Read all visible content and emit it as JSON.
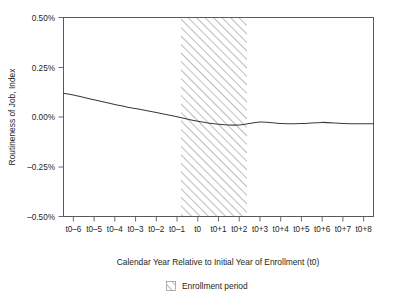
{
  "chart_data": {
    "type": "line",
    "title": "",
    "xlabel": "Calendar Year Relative to Initial Year of Enrollment (t0)",
    "ylabel": "Routineness of Job, Index",
    "x": [
      "t0–6",
      "t0–5",
      "t0–4",
      "t0–3",
      "t0–2",
      "t0–1",
      "t0",
      "t0+1",
      "t0+2",
      "t0+3",
      "t0+4",
      "t0+5",
      "t0+6",
      "t0+7",
      "t0+8"
    ],
    "xtick_labels": [
      "t0–6",
      "t0–5",
      "t0–4",
      "t0–3",
      "t0–2",
      "t0–1",
      "t0",
      "t0+1",
      "t0+2",
      "t0+3",
      "t0+4",
      "t0+5",
      "t0+6",
      "t0+7",
      "t0+8"
    ],
    "ytick_labels": [
      "0.50%",
      "0.25%",
      "0.00%",
      "–0.25%",
      "–0.50%"
    ],
    "ytick_values": [
      0.5,
      0.25,
      0.0,
      -0.25,
      -0.5
    ],
    "ylim": [
      -0.5,
      0.5
    ],
    "grid": false,
    "legend_position": "below-axis-center",
    "series": [
      {
        "name": "Routineness of Job, Index",
        "values": [
          0.11,
          0.086,
          0.063,
          0.042,
          0.022,
          0.001,
          -0.021,
          -0.036,
          -0.04,
          -0.025,
          -0.032,
          -0.033,
          -0.027,
          -0.032,
          -0.034
        ]
      }
    ],
    "shaded_region": {
      "label": "Enrollment period",
      "start": "t0–1",
      "end": "t0+2.2",
      "style": "diagonal-hatch"
    },
    "annotations": []
  },
  "legend": {
    "entries": [
      {
        "label": "Enrollment period",
        "swatch": "hatched-square"
      }
    ]
  },
  "axes": {
    "y_title": "Routineness of Job, Index",
    "x_title": "Calendar Year Relative to Initial Year of Enrollment (t0)"
  }
}
